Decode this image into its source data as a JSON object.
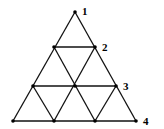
{
  "diagram": {
    "type": "triangular-grid",
    "rows": 4,
    "colors": {
      "line": "#111111",
      "node": "#000000",
      "background": "#ffffff"
    },
    "nodes": [
      {
        "id": "r1c1",
        "x": 75,
        "y": 12
      },
      {
        "id": "r2c1",
        "x": 54,
        "y": 47
      },
      {
        "id": "r2c2",
        "x": 95,
        "y": 47
      },
      {
        "id": "r3c1",
        "x": 33,
        "y": 86
      },
      {
        "id": "r3c2",
        "x": 75,
        "y": 86
      },
      {
        "id": "r3c3",
        "x": 116,
        "y": 86
      },
      {
        "id": "r4c1",
        "x": 13,
        "y": 121
      },
      {
        "id": "r4c2",
        "x": 54,
        "y": 121
      },
      {
        "id": "r4c3",
        "x": 95,
        "y": 121
      },
      {
        "id": "r4c4",
        "x": 136,
        "y": 121
      }
    ],
    "labels": [
      {
        "text": "1",
        "x": 82,
        "y": 15
      },
      {
        "text": "2",
        "x": 102,
        "y": 51
      },
      {
        "text": "3",
        "x": 123,
        "y": 90
      },
      {
        "text": "4",
        "x": 143,
        "y": 125
      }
    ]
  }
}
